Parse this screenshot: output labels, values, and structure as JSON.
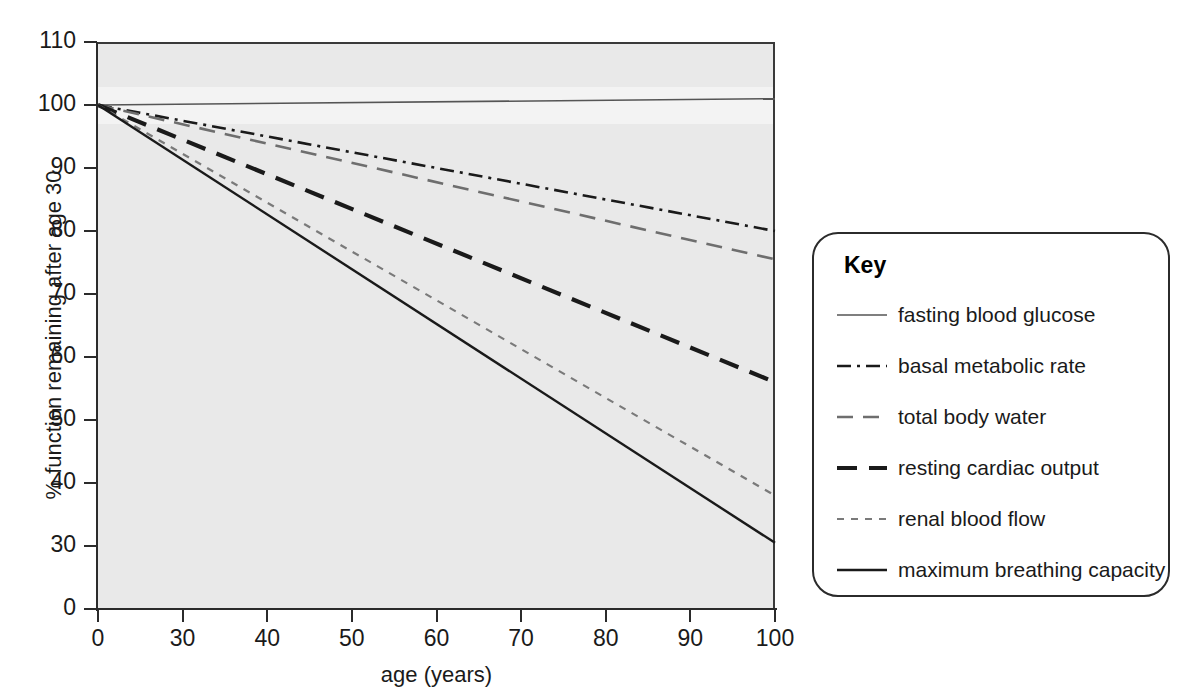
{
  "chart_data": {
    "type": "line",
    "title": "",
    "xlabel": "age (years)",
    "ylabel": "% function remaining after age 30",
    "x_ticks": [
      "0",
      "30",
      "40",
      "50",
      "60",
      "70",
      "80",
      "90",
      "100"
    ],
    "x_tick_values": [
      0,
      30,
      40,
      50,
      60,
      70,
      80,
      90,
      100
    ],
    "y_ticks": [
      "0",
      "30",
      "40",
      "50",
      "60",
      "70",
      "80",
      "90",
      "100",
      "110"
    ],
    "y_tick_values": [
      0,
      30,
      40,
      50,
      60,
      70,
      80,
      90,
      100,
      110
    ],
    "xlim": [
      0,
      100
    ],
    "ylim": [
      0,
      110
    ],
    "axis_note": "both axes are broken: x jumps 0 to 30, y jumps 0 to 30",
    "grid": false,
    "legend_position": "right",
    "plot_background": "#e9e9e9",
    "series": [
      {
        "name": "fasting blood glucose",
        "style": "solid-thin",
        "color": "#555555",
        "x": [
          0,
          100
        ],
        "values": [
          100,
          101
        ]
      },
      {
        "name": "basal metabolic rate",
        "style": "dash-dot",
        "color": "#1a1a1a",
        "x": [
          0,
          100
        ],
        "values": [
          100,
          80
        ]
      },
      {
        "name": "total body water",
        "style": "dashed",
        "color": "#6e6e6e",
        "x": [
          0,
          100
        ],
        "values": [
          100,
          75.5
        ]
      },
      {
        "name": "resting cardiac output",
        "style": "dashed-bold",
        "color": "#1a1a1a",
        "x": [
          0,
          100
        ],
        "values": [
          100,
          56
        ]
      },
      {
        "name": "renal blood flow",
        "style": "dotted",
        "color": "#7a7a7a",
        "x": [
          0,
          100
        ],
        "values": [
          100,
          38
        ]
      },
      {
        "name": "maximum breathing capacity",
        "style": "solid",
        "color": "#1a1a1a",
        "x": [
          0,
          100
        ],
        "values": [
          100,
          30.5
        ]
      }
    ]
  },
  "legend": {
    "title": "Key",
    "items": [
      {
        "label": "fasting blood glucose"
      },
      {
        "label": "basal metabolic rate"
      },
      {
        "label": "total body water"
      },
      {
        "label": "resting cardiac output"
      },
      {
        "label": "renal blood flow"
      },
      {
        "label": "maximum breathing capacity"
      }
    ]
  }
}
